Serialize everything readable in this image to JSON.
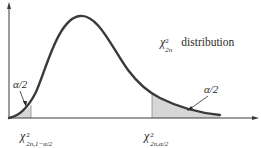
{
  "figure": {
    "curve_label": {
      "symbol": "χ",
      "superscript": "2",
      "subscript": "2n",
      "text": "distribution"
    },
    "left_tail": {
      "area_label": "α/2",
      "quantile": {
        "symbol": "χ",
        "superscript": "2",
        "subscript": "2n,1−α/2"
      }
    },
    "right_tail": {
      "area_label": "α/2",
      "quantile": {
        "symbol": "χ",
        "superscript": "2",
        "subscript": "2n,α/2"
      }
    },
    "colors": {
      "curve": "#3a3a3a",
      "axis": "#3a3a3a",
      "shade": "#d6d6d6",
      "text": "#2b2b2b"
    }
  }
}
